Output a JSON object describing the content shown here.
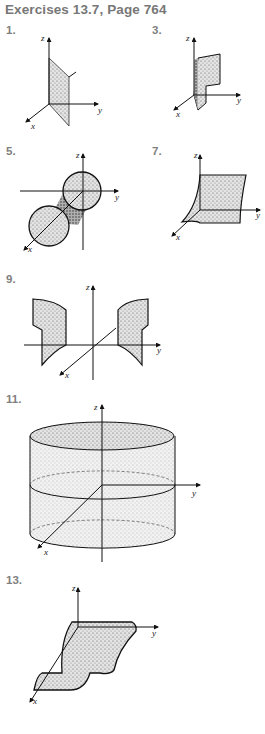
{
  "header": {
    "title": "Exercises 13.7, Page 764"
  },
  "exercises": [
    {
      "number": "1.",
      "axes": [
        "z",
        "y",
        "x"
      ],
      "description": "plane surface parallel to z-axis"
    },
    {
      "number": "3.",
      "axes": [
        "z",
        "y",
        "x"
      ],
      "description": "curved cylindrical sheet"
    },
    {
      "number": "5.",
      "axes": [
        "z",
        "y",
        "x"
      ],
      "description": "circular cylinder along x-axis"
    },
    {
      "number": "7.",
      "axes": [
        "z",
        "y",
        "x"
      ],
      "description": "parabolic cylinder sheet"
    },
    {
      "number": "9.",
      "axes": [
        "z",
        "y",
        "x"
      ],
      "description": "pair of curved cylindrical sheets"
    },
    {
      "number": "11.",
      "axes": [
        "z",
        "y",
        "x"
      ],
      "description": "right circular cylinder about z-axis"
    },
    {
      "number": "13.",
      "axes": [
        "z",
        "y",
        "x"
      ],
      "description": "cubic-shaped cylinder sheet"
    }
  ]
}
